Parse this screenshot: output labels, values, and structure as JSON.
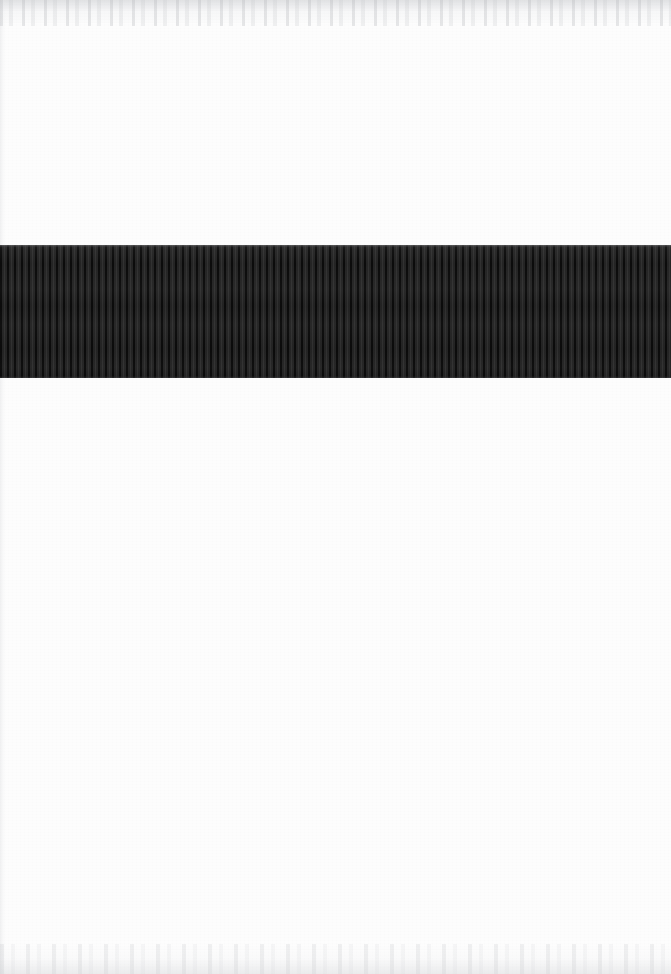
{
  "page": {
    "width_px": 671,
    "height_px": 974,
    "background_color": "#fdfdfd"
  },
  "regions": {
    "upper_blank": {
      "name": "upper-blank-area",
      "top_px": 0,
      "height_px": 245,
      "color": "#fdfdfd"
    },
    "dark_band": {
      "name": "dark-striped-band",
      "top_px": 245,
      "height_px": 133,
      "left_px": 0,
      "width_px": 671,
      "base_color": "#1c1c1c",
      "stripe_dark_color": "#0b0b0b",
      "stripe_light_color": "#313131",
      "stripe_period_px": 7,
      "stripe_orientation": "vertical"
    },
    "lower_blank": {
      "name": "lower-blank-area",
      "top_px": 378,
      "height_px": 596,
      "color": "#ffffff"
    }
  },
  "artifacts": {
    "top_edge_noise": "faint-gray-scan-mottling",
    "bottom_edge_noise": "faint-gray-scan-mottling",
    "left_edge_line": "faint-light-vertical-scan-edge"
  }
}
